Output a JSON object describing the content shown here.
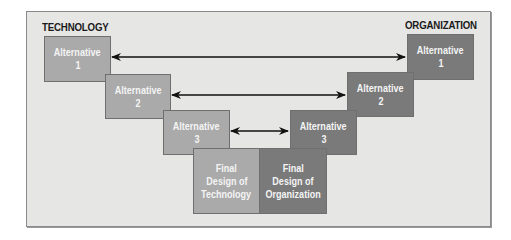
{
  "headings": {
    "left": "TECHNOLOGY",
    "right": "ORGANIZATION"
  },
  "technology": [
    {
      "line1": "Alternative",
      "line2": "1"
    },
    {
      "line1": "Alternative",
      "line2": "2"
    },
    {
      "line1": "Alternative",
      "line2": "3"
    }
  ],
  "organization": [
    {
      "line1": "Alternative",
      "line2": "1"
    },
    {
      "line1": "Alternative",
      "line2": "2"
    },
    {
      "line1": "Alternative",
      "line2": "3"
    }
  ],
  "final": {
    "technology": {
      "line1": "Final",
      "line2": "Design of",
      "line3": "Technology"
    },
    "organization": {
      "line1": "Final",
      "line2": "Design of",
      "line3": "Organization"
    }
  },
  "connectors": [
    {
      "from": "technology.0",
      "to": "organization.0",
      "type": "double-arrow"
    },
    {
      "from": "technology.1",
      "to": "organization.1",
      "type": "double-arrow"
    },
    {
      "from": "technology.2",
      "to": "organization.2",
      "type": "double-arrow"
    }
  ],
  "colors": {
    "panel": "#e6e6e4",
    "technology_box": "#aaaaaa",
    "organization_box": "#7a7a7a",
    "box_text": "#f4f4f4",
    "arrow": "#111111"
  }
}
